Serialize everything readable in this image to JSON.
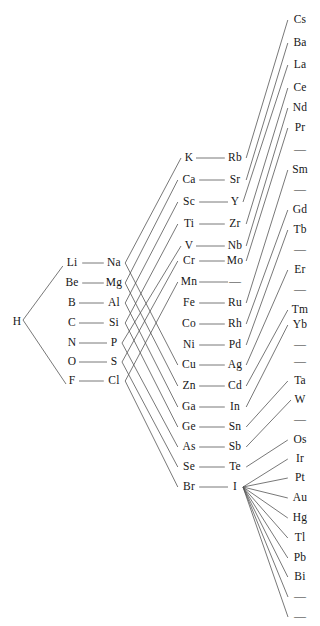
{
  "figure": {
    "title_strip": "",
    "background_color": "#ffffff",
    "line_color": "#555555",
    "text_color": "#161616",
    "blank_symbol": "—"
  },
  "columns": [
    {
      "id": "col-hydrogen",
      "name": "hydrogen-column",
      "x": 17,
      "elements": [
        {
          "label": "H",
          "y": 322
        }
      ]
    },
    {
      "id": "col-period2",
      "name": "period-2-column",
      "x": 72,
      "elements": [
        {
          "label": "Li",
          "y": 263
        },
        {
          "label": "Be",
          "y": 283
        },
        {
          "label": "B",
          "y": 303
        },
        {
          "label": "C",
          "y": 323
        },
        {
          "label": "N",
          "y": 343
        },
        {
          "label": "O",
          "y": 362
        },
        {
          "label": "F",
          "y": 381
        }
      ]
    },
    {
      "id": "col-period3",
      "name": "period-3-column",
      "x": 114,
      "elements": [
        {
          "label": "Na",
          "y": 263
        },
        {
          "label": "Mg",
          "y": 283
        },
        {
          "label": "Al",
          "y": 303
        },
        {
          "label": "Si",
          "y": 323
        },
        {
          "label": "P",
          "y": 343
        },
        {
          "label": "S",
          "y": 362
        },
        {
          "label": "Cl",
          "y": 381
        }
      ]
    },
    {
      "id": "col-period4",
      "name": "period-4-column",
      "x": 189,
      "elements": [
        {
          "label": "K",
          "y": 158
        },
        {
          "label": "Ca",
          "y": 180
        },
        {
          "label": "Sc",
          "y": 202
        },
        {
          "label": "Ti",
          "y": 224
        },
        {
          "label": "V",
          "y": 246
        },
        {
          "label": "Cr",
          "y": 261
        },
        {
          "label": "Mn",
          "y": 282
        },
        {
          "label": "Fe",
          "y": 303
        },
        {
          "label": "Co",
          "y": 324
        },
        {
          "label": "Ni",
          "y": 345
        },
        {
          "label": "Cu",
          "y": 365
        },
        {
          "label": "Zn",
          "y": 386
        },
        {
          "label": "Ga",
          "y": 407
        },
        {
          "label": "Ge",
          "y": 427
        },
        {
          "label": "As",
          "y": 447
        },
        {
          "label": "Se",
          "y": 467
        },
        {
          "label": "Br",
          "y": 487
        }
      ]
    },
    {
      "id": "col-period5",
      "name": "period-5-column",
      "x": 235,
      "elements": [
        {
          "label": "Rb",
          "y": 158
        },
        {
          "label": "Sr",
          "y": 180
        },
        {
          "label": "Y",
          "y": 202
        },
        {
          "label": "Zr",
          "y": 224
        },
        {
          "label": "Nb",
          "y": 246
        },
        {
          "label": "Mo",
          "y": 261
        },
        {
          "label": "—",
          "y": 282
        },
        {
          "label": "Ru",
          "y": 303
        },
        {
          "label": "Rh",
          "y": 324
        },
        {
          "label": "Pd",
          "y": 345
        },
        {
          "label": "Ag",
          "y": 365
        },
        {
          "label": "Cd",
          "y": 386
        },
        {
          "label": "In",
          "y": 407
        },
        {
          "label": "Sn",
          "y": 427
        },
        {
          "label": "Sb",
          "y": 447
        },
        {
          "label": "Te",
          "y": 467
        },
        {
          "label": "I",
          "y": 487
        }
      ]
    },
    {
      "id": "col-period6",
      "name": "period-6-column",
      "x": 300,
      "elements": [
        {
          "label": "Cs",
          "y": 20
        },
        {
          "label": "Ba",
          "y": 43
        },
        {
          "label": "La",
          "y": 65
        },
        {
          "label": "Ce",
          "y": 88
        },
        {
          "label": "Nd",
          "y": 108
        },
        {
          "label": "Pr",
          "y": 128
        },
        {
          "label": "—",
          "y": 150
        },
        {
          "label": "Sm",
          "y": 170
        },
        {
          "label": "—",
          "y": 190
        },
        {
          "label": "Gd",
          "y": 210
        },
        {
          "label": "Tb",
          "y": 230
        },
        {
          "label": "—",
          "y": 250
        },
        {
          "label": "Er",
          "y": 270
        },
        {
          "label": "—",
          "y": 290
        },
        {
          "label": "Tm",
          "y": 310
        },
        {
          "label": "Yb",
          "y": 325
        },
        {
          "label": "—",
          "y": 345
        },
        {
          "label": "—",
          "y": 362
        },
        {
          "label": "Ta",
          "y": 381
        },
        {
          "label": "W",
          "y": 400
        },
        {
          "label": "—",
          "y": 420
        },
        {
          "label": "Os",
          "y": 440
        },
        {
          "label": "Ir",
          "y": 459
        },
        {
          "label": "Pt",
          "y": 478
        },
        {
          "label": "Au",
          "y": 498
        },
        {
          "label": "Hg",
          "y": 518
        },
        {
          "label": "Tl",
          "y": 538
        },
        {
          "label": "Pb",
          "y": 558
        },
        {
          "label": "Bi",
          "y": 577
        },
        {
          "label": "—",
          "y": 597
        },
        {
          "label": "—",
          "y": 617
        }
      ]
    }
  ],
  "bonds": {
    "hydrogen_links": [
      {
        "from": "H",
        "to": "Li"
      },
      {
        "from": "H",
        "to": "F"
      }
    ],
    "horizontal_pairs": [
      {
        "left": "Li",
        "right": "Na"
      },
      {
        "left": "Be",
        "right": "Mg"
      },
      {
        "left": "B",
        "right": "Al"
      },
      {
        "left": "C",
        "right": "Si"
      },
      {
        "left": "N",
        "right": "P"
      },
      {
        "left": "O",
        "right": "S"
      },
      {
        "left": "F",
        "right": "Cl"
      },
      {
        "left": "K",
        "right": "Rb"
      },
      {
        "left": "Ca",
        "right": "Sr"
      },
      {
        "left": "Sc",
        "right": "Y"
      },
      {
        "left": "Ti",
        "right": "Zr"
      },
      {
        "left": "V",
        "right": "Nb"
      },
      {
        "left": "Cr",
        "right": "Mo"
      },
      {
        "left": "Mn",
        "right": "—"
      },
      {
        "left": "Fe",
        "right": "Ru"
      },
      {
        "left": "Co",
        "right": "Rh"
      },
      {
        "left": "Ni",
        "right": "Pd"
      },
      {
        "left": "Cu",
        "right": "Ag"
      },
      {
        "left": "Zn",
        "right": "Cd"
      },
      {
        "left": "Ga",
        "right": "In"
      },
      {
        "left": "Ge",
        "right": "Sn"
      },
      {
        "left": "As",
        "right": "Sb"
      },
      {
        "left": "Se",
        "right": "Te"
      },
      {
        "left": "Br",
        "right": "I"
      }
    ],
    "period3_to_period4": [
      {
        "from": "Na",
        "to": "K"
      },
      {
        "from": "Mg",
        "to": "Ca"
      },
      {
        "from": "Al",
        "to": "Sc"
      },
      {
        "from": "Si",
        "to": "Ti"
      },
      {
        "from": "P",
        "to": "V"
      },
      {
        "from": "S",
        "to": "Cr"
      },
      {
        "from": "Cl",
        "to": "Mn"
      },
      {
        "from": "Na",
        "to": "Cu"
      },
      {
        "from": "Mg",
        "to": "Zn"
      },
      {
        "from": "Al",
        "to": "Ga"
      },
      {
        "from": "Si",
        "to": "Ge"
      },
      {
        "from": "P",
        "to": "As"
      },
      {
        "from": "S",
        "to": "Se"
      },
      {
        "from": "Cl",
        "to": "Br"
      }
    ],
    "period5_to_period6": [
      {
        "from": "Rb",
        "to": "Cs"
      },
      {
        "from": "Sr",
        "to": "Ba"
      },
      {
        "from": "Y",
        "to": "La"
      },
      {
        "from": "Zr",
        "to": "Ce"
      },
      {
        "from": "Nb",
        "to": "Nd"
      },
      {
        "from": "Mo",
        "to": "Pr"
      },
      {
        "from": "Ru",
        "to": "Sm"
      },
      {
        "from": "Rh",
        "to": "Gd"
      },
      {
        "from": "Pd",
        "to": "Tb"
      },
      {
        "from": "Ag",
        "to": "Er"
      },
      {
        "from": "Cd",
        "to": "Tm"
      },
      {
        "from": "In",
        "to": "Yb"
      },
      {
        "from": "Sn",
        "to": "Ta"
      },
      {
        "from": "Sb",
        "to": "W"
      },
      {
        "from": "Te",
        "to": "Os"
      },
      {
        "from": "I",
        "to": "Ir"
      },
      {
        "from": "I",
        "to": "Pt"
      },
      {
        "from": "I",
        "to": "Au"
      },
      {
        "from": "I",
        "to": "Hg"
      },
      {
        "from": "I",
        "to": "Tl"
      },
      {
        "from": "I",
        "to": "Pb"
      },
      {
        "from": "I",
        "to": "Bi"
      }
    ]
  }
}
